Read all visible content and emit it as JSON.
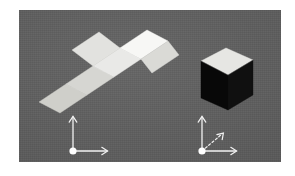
{
  "scene": {
    "title": "cube net and folded cube",
    "page_background": "#ffffff",
    "panel": {
      "background": "#5e5e5e",
      "x": 19,
      "y": 10,
      "width": 262,
      "height": 152
    },
    "net": {
      "label": "unfolded cube net",
      "shape": "latin-cross",
      "panel_count": 6,
      "faces": [
        {
          "name": "net-face-center",
          "fill": "#e9e9e7"
        },
        {
          "name": "net-face-top",
          "fill": "#f7f7f5"
        },
        {
          "name": "net-face-upper-left",
          "fill": "#e2e2df"
        },
        {
          "name": "net-face-right",
          "fill": "#dadad6"
        },
        {
          "name": "net-face-lower-left",
          "fill": "#d6d6d2"
        },
        {
          "name": "net-face-bottom-left",
          "fill": "#cfcfca"
        }
      ]
    },
    "cube": {
      "label": "folded cube",
      "faces": [
        {
          "name": "cube-face-top",
          "fill": "#e6e6e3"
        },
        {
          "name": "cube-face-front",
          "fill": "#080808"
        },
        {
          "name": "cube-face-right",
          "fill": "#101010"
        }
      ]
    },
    "gizmo_left": {
      "label": "2-axis coordinate frame",
      "origin_color": "#ffffff",
      "axis_color": "#f2f2f2",
      "axes": [
        {
          "name": "axis-y-up",
          "style": "solid",
          "direction": "up"
        },
        {
          "name": "axis-x-right",
          "style": "solid",
          "direction": "right"
        }
      ]
    },
    "gizmo_right": {
      "label": "3-axis coordinate frame",
      "origin_color": "#ffffff",
      "axis_color": "#f2f2f2",
      "axes": [
        {
          "name": "axis-y-up",
          "style": "solid",
          "direction": "up"
        },
        {
          "name": "axis-x-right",
          "style": "solid",
          "direction": "right"
        },
        {
          "name": "axis-z-diagonal",
          "style": "dashed",
          "direction": "up-right"
        }
      ]
    }
  }
}
